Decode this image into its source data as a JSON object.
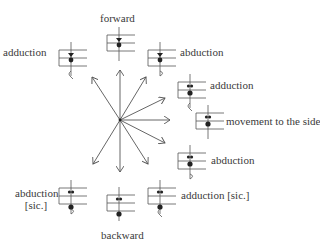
{
  "diagram": {
    "center": {
      "x": 120,
      "y": 120
    },
    "arrows": [
      {
        "dir": "up-left",
        "x": 92,
        "y": 77
      },
      {
        "dir": "up",
        "x": 120,
        "y": 70
      },
      {
        "dir": "up-right",
        "x": 146,
        "y": 77
      },
      {
        "dir": "right-up",
        "x": 165,
        "y": 98
      },
      {
        "dir": "right",
        "x": 170,
        "y": 120
      },
      {
        "dir": "right-down",
        "x": 165,
        "y": 143
      },
      {
        "dir": "down-right",
        "x": 148,
        "y": 164
      },
      {
        "dir": "down",
        "x": 120,
        "y": 172
      },
      {
        "dir": "down-left",
        "x": 93,
        "y": 164
      }
    ],
    "symbols": [
      {
        "id": "left-top",
        "x": 59,
        "y": 42,
        "notes": "heart-top",
        "tail": "hook-left",
        "label": "adduction"
      },
      {
        "id": "top",
        "x": 107,
        "y": 27,
        "notes": "heart-top",
        "tail": "none",
        "label": "forward"
      },
      {
        "id": "right-top",
        "x": 148,
        "y": 42,
        "notes": "heart-top",
        "tail": "hook-right",
        "label": "abduction"
      },
      {
        "id": "right-upper",
        "x": 178,
        "y": 74,
        "notes": "pair-mid",
        "tail": "hook-left",
        "label": "adduction"
      },
      {
        "id": "right",
        "x": 196,
        "y": 105,
        "notes": "pair-mid",
        "tail": "none",
        "label": "movement to the side"
      },
      {
        "id": "right-lower",
        "x": 178,
        "y": 145,
        "notes": "pair-mid",
        "tail": "hook-right",
        "label": "abduction"
      },
      {
        "id": "bottom-right",
        "x": 148,
        "y": 180,
        "notes": "pair-low",
        "tail": "hook-left",
        "label": "adduction [sic.]"
      },
      {
        "id": "bottom",
        "x": 107,
        "y": 187,
        "notes": "pair-low",
        "tail": "none",
        "label": "backward"
      },
      {
        "id": "bottom-left",
        "x": 59,
        "y": 180,
        "notes": "pair-low",
        "tail": "hook-right",
        "label_line1": "abduction",
        "label_line2": "[sic.]"
      }
    ],
    "colors": {
      "stroke": "#555555",
      "ink": "#222222",
      "text": "#3a3a3a"
    }
  }
}
